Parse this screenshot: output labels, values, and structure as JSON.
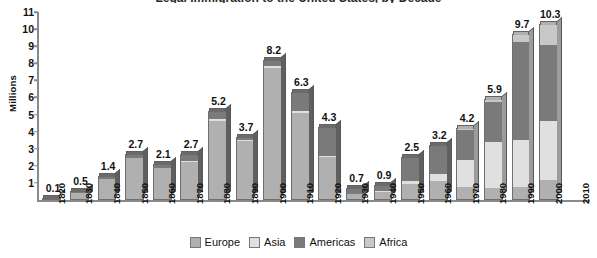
{
  "chart_data": {
    "type": "bar",
    "subtype": "stacked-column-3d",
    "title": "Legal Immigration to the United States, by Decade",
    "xlabel": "",
    "ylabel": "Millions",
    "ylim": [
      0,
      11
    ],
    "ytick_step": 1,
    "yticks": [
      "11",
      "10",
      "9",
      "8",
      "7",
      "6",
      "5",
      "4",
      "3",
      "2",
      "1"
    ],
    "grid": false,
    "legend_position": "bottom",
    "categories": [
      "1820",
      "1830",
      "1840",
      "1850",
      "1860",
      "1870",
      "1880",
      "1890",
      "1900",
      "1910",
      "1920",
      "1930",
      "1940",
      "1950",
      "1960",
      "1970",
      "1980",
      "1990",
      "2000",
      "2010"
    ],
    "totals": [
      0.1,
      0.5,
      1.4,
      2.7,
      2.1,
      2.7,
      5.2,
      3.7,
      8.2,
      6.3,
      4.3,
      0.7,
      0.9,
      2.5,
      3.2,
      4.2,
      5.9,
      9.7,
      10.3,
      null
    ],
    "total_labels": [
      "0.1",
      "0.5",
      "1.4",
      "2.7",
      "2.1",
      "2.7",
      "5.2",
      "3.7",
      "8.2",
      "6.3",
      "4.3",
      "0.7",
      "0.9",
      "2.5",
      "3.2",
      "4.2",
      "5.9",
      "9.7",
      "10.3",
      ""
    ],
    "series": [
      {
        "name": "Europe",
        "color": "#b0b0b0",
        "values": [
          0.09,
          0.45,
          1.3,
          2.5,
          1.9,
          2.25,
          4.7,
          3.5,
          7.8,
          5.1,
          2.5,
          0.35,
          0.5,
          0.95,
          1.1,
          0.75,
          0.65,
          0.7,
          1.1,
          null
        ]
      },
      {
        "name": "Asia",
        "color": "#e0e0e0",
        "values": [
          0.0,
          0.0,
          0.0,
          0.02,
          0.04,
          0.07,
          0.07,
          0.07,
          0.1,
          0.12,
          0.11,
          0.02,
          0.04,
          0.15,
          0.43,
          1.59,
          2.74,
          2.8,
          3.5,
          null
        ]
      },
      {
        "name": "Americas",
        "color": "#7a7a7a",
        "values": [
          0.01,
          0.05,
          0.1,
          0.18,
          0.16,
          0.38,
          0.43,
          0.13,
          0.3,
          1.08,
          1.69,
          0.33,
          0.36,
          1.4,
          1.67,
          1.8,
          2.4,
          5.8,
          4.5,
          null
        ]
      },
      {
        "name": "Africa",
        "color": "#c8c8c8",
        "values": [
          0.0,
          0.0,
          0.0,
          0.0,
          0.0,
          0.0,
          0.0,
          0.0,
          0.0,
          0.0,
          0.0,
          0.0,
          0.0,
          0.0,
          0.0,
          0.06,
          0.11,
          0.4,
          1.2,
          null
        ]
      }
    ]
  },
  "legend": {
    "items": [
      {
        "label": "Europe",
        "color": "#b0b0b0"
      },
      {
        "label": "Asia",
        "color": "#e0e0e0"
      },
      {
        "label": "Americas",
        "color": "#7a7a7a"
      },
      {
        "label": "Africa",
        "color": "#c8c8c8"
      }
    ]
  }
}
